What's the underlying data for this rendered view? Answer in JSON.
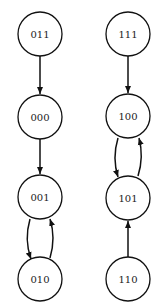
{
  "diagram": {
    "type": "state-transition-graph",
    "nodes": [
      {
        "id": "011",
        "label": "011",
        "x": 40,
        "y": 34
      },
      {
        "id": "000",
        "label": "000",
        "x": 40,
        "y": 117
      },
      {
        "id": "001",
        "label": "001",
        "x": 40,
        "y": 197
      },
      {
        "id": "010",
        "label": "010",
        "x": 40,
        "y": 279
      },
      {
        "id": "111",
        "label": "111",
        "x": 128,
        "y": 34
      },
      {
        "id": "100",
        "label": "100",
        "x": 128,
        "y": 116
      },
      {
        "id": "101",
        "label": "101",
        "x": 128,
        "y": 198
      },
      {
        "id": "110",
        "label": "110",
        "x": 128,
        "y": 279
      }
    ],
    "edges": [
      {
        "from": "011",
        "to": "000"
      },
      {
        "from": "000",
        "to": "001"
      },
      {
        "from": "001",
        "to": "010"
      },
      {
        "from": "010",
        "to": "001"
      },
      {
        "from": "111",
        "to": "100"
      },
      {
        "from": "100",
        "to": "101"
      },
      {
        "from": "101",
        "to": "100"
      },
      {
        "from": "110",
        "to": "101"
      }
    ]
  }
}
